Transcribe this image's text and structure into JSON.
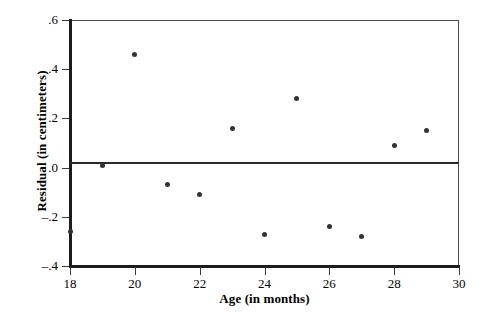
{
  "chart_data": {
    "type": "scatter",
    "title": "",
    "xlabel": "Age (in months)",
    "ylabel": "Residual (in centimeters)",
    "xlim": [
      18,
      30
    ],
    "ylim": [
      -0.4,
      0.6
    ],
    "xticks": [
      18,
      20,
      22,
      24,
      26,
      28,
      30
    ],
    "xtick_labels": [
      "18",
      "20",
      "22",
      "24",
      "26",
      "28",
      "30"
    ],
    "yticks": [
      0.6,
      0.4,
      0.2,
      0.0,
      -0.2,
      -0.4
    ],
    "ytick_labels": [
      ".6",
      ".4",
      ".2",
      ".0",
      "–.2",
      "–.4"
    ],
    "grid": false,
    "legend": null,
    "reference_line": {
      "axis": "y",
      "value": 0.0,
      "label": "zero residual line"
    },
    "x": [
      18,
      19,
      20,
      21,
      22,
      23,
      24,
      25,
      26,
      27,
      28,
      29
    ],
    "y": [
      -0.26,
      0.01,
      0.46,
      -0.07,
      -0.11,
      0.16,
      -0.27,
      0.28,
      -0.24,
      -0.28,
      0.09,
      0.15
    ],
    "points": [
      {
        "x": 18,
        "y": -0.26
      },
      {
        "x": 19,
        "y": 0.01
      },
      {
        "x": 20,
        "y": 0.46
      },
      {
        "x": 21,
        "y": -0.07
      },
      {
        "x": 22,
        "y": -0.11
      },
      {
        "x": 23,
        "y": 0.16
      },
      {
        "x": 24,
        "y": -0.27
      },
      {
        "x": 25,
        "y": 0.28
      },
      {
        "x": 26,
        "y": -0.24
      },
      {
        "x": 27,
        "y": -0.28
      },
      {
        "x": 28,
        "y": 0.09
      },
      {
        "x": 29,
        "y": 0.15
      }
    ],
    "marker": {
      "shape": "circle",
      "color": "#333333",
      "size": 5
    },
    "colors": {
      "axis": "#1c1c1c",
      "frame": "#4a4a4a",
      "text": "#000000",
      "background": "#ffffff"
    }
  }
}
